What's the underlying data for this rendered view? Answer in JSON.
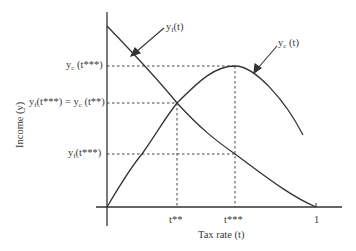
{
  "diagram": {
    "title": "",
    "x_axis": {
      "label": "Tax rate (t)",
      "ticks": [
        {
          "label": "t**",
          "x": 177
        },
        {
          "label": "t***",
          "x": 235
        },
        {
          "label": "1",
          "x": 316
        }
      ]
    },
    "y_axis": {
      "label": "Income (y)",
      "ticks": [
        {
          "prefix": "y",
          "sub": "c",
          "suffix": " (t***)",
          "y": 66
        },
        {
          "prefix": "y",
          "sub": "f",
          "suffix": "(t***) = y",
          "sub2": "c",
          "suffix2": " (t**)",
          "y": 103
        },
        {
          "prefix": "y",
          "sub": "f",
          "suffix": "(t***)",
          "y": 154
        }
      ]
    },
    "curves": [
      {
        "name": "yf(t)",
        "label_base": "y",
        "label_sub": "f",
        "label_arg": "(t)",
        "description": "decreasing curve from top of y-axis to t=1"
      },
      {
        "name": "yc(t)",
        "label_base": "y",
        "label_sub": "c",
        "label_arg": " (t)",
        "description": "hump-shaped curve peaking at t***"
      }
    ],
    "colors": {
      "line": "#333333",
      "dashed": "#444444",
      "text": "#3a3a3a"
    }
  }
}
